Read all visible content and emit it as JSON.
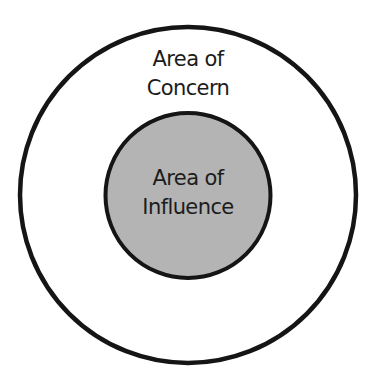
{
  "diagram": {
    "outer_circle": {
      "label_lines": [
        "Area of",
        "Concern"
      ],
      "fill": "#ffffff",
      "stroke": "#151515"
    },
    "inner_circle": {
      "label_lines": [
        "Area of",
        "Influence"
      ],
      "fill": "#b4b4b4",
      "stroke": "#151515"
    }
  }
}
